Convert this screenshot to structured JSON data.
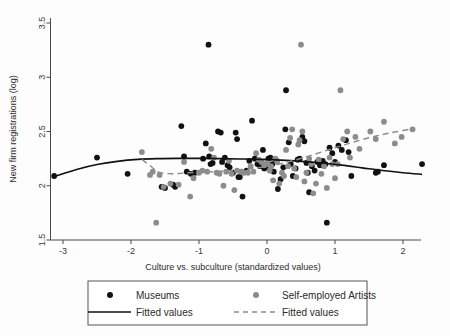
{
  "chart_data": {
    "type": "scatter",
    "title": "",
    "xlabel": "Culture vs. subculture (standardized values)",
    "ylabel": "New firm registrations (log)",
    "xlim": [
      -3.35,
      2.45
    ],
    "ylim": [
      1.45,
      3.58
    ],
    "xticks": [
      -3,
      -2,
      -1,
      0,
      1,
      2
    ],
    "xtick_labels": [
      "-3",
      "-2",
      "-1",
      "0",
      "1",
      "2"
    ],
    "yticks": [
      1.5,
      2,
      2.5,
      3,
      3.5
    ],
    "ytick_labels": [
      "1.5",
      "2",
      "2.5",
      "3",
      "3.5"
    ],
    "grid": false,
    "legend_position": "below-axes",
    "colors": {
      "museums": "#111111",
      "artists": "#8c8c8c",
      "fit_museums": "#111111",
      "fit_artists": "#8c8c8c",
      "axis": "#4a4a4a",
      "background": "#ffffff"
    },
    "series": [
      {
        "name": "Museums",
        "marker": "filled-circle",
        "color": "#111111",
        "points": [
          [
            -3.13,
            2.09
          ],
          [
            -2.5,
            2.26
          ],
          [
            -2.05,
            2.11
          ],
          [
            -1.55,
            1.99
          ],
          [
            -1.5,
            1.98
          ],
          [
            -1.38,
            2.01
          ],
          [
            -1.35,
            1.99
          ],
          [
            -1.26,
            2.55
          ],
          [
            -1.22,
            2.27
          ],
          [
            -1.18,
            2.13
          ],
          [
            -1.12,
            2.11
          ],
          [
            -1.06,
            2.12
          ],
          [
            -0.94,
            2.25
          ],
          [
            -0.9,
            2.39
          ],
          [
            -0.86,
            3.3
          ],
          [
            -0.85,
            2.27
          ],
          [
            -0.83,
            2.2
          ],
          [
            -0.8,
            2.21
          ],
          [
            -0.72,
            2.5
          ],
          [
            -0.68,
            2.49
          ],
          [
            -0.66,
            2.22
          ],
          [
            -0.62,
            2.26
          ],
          [
            -0.58,
            2.19
          ],
          [
            -0.55,
            2.17
          ],
          [
            -0.5,
            2.12
          ],
          [
            -0.46,
            2.49
          ],
          [
            -0.44,
            2.43
          ],
          [
            -0.42,
            2.08
          ],
          [
            -0.4,
            2.08
          ],
          [
            -0.36,
            1.9
          ],
          [
            -0.3,
            2.14
          ],
          [
            -0.26,
            2.23
          ],
          [
            -0.22,
            2.6
          ],
          [
            -0.18,
            2.25
          ],
          [
            -0.14,
            2.2
          ],
          [
            -0.1,
            2.18
          ],
          [
            -0.06,
            2.33
          ],
          [
            -0.04,
            2.16
          ],
          [
            -0.02,
            2.17
          ],
          [
            0.02,
            2.25
          ],
          [
            0.05,
            2.26
          ],
          [
            0.08,
            2.2
          ],
          [
            0.1,
            2.13
          ],
          [
            0.13,
            2.24
          ],
          [
            0.16,
            1.97
          ],
          [
            0.2,
            2.06
          ],
          [
            0.24,
            2.17
          ],
          [
            0.27,
            2.52
          ],
          [
            0.28,
            2.88
          ],
          [
            0.32,
            2.4
          ],
          [
            0.35,
            2.2
          ],
          [
            0.38,
            2.09
          ],
          [
            0.42,
            2.16
          ],
          [
            0.45,
            2.24
          ],
          [
            0.48,
            2.25
          ],
          [
            0.52,
            2.45
          ],
          [
            0.55,
            2.41
          ],
          [
            0.58,
            2.21
          ],
          [
            0.6,
            2.12
          ],
          [
            0.62,
            1.94
          ],
          [
            0.66,
            2.18
          ],
          [
            0.7,
            2.14
          ],
          [
            0.74,
            2.22
          ],
          [
            0.78,
            2.19
          ],
          [
            0.82,
            2.23
          ],
          [
            0.86,
            2.2
          ],
          [
            0.88,
            1.66
          ],
          [
            0.92,
            2.35
          ],
          [
            0.96,
            2.3
          ],
          [
            1.0,
            2.22
          ],
          [
            1.05,
            2.37
          ],
          [
            1.1,
            2.33
          ],
          [
            1.16,
            2.42
          ],
          [
            1.2,
            2.31
          ],
          [
            1.24,
            2.09
          ],
          [
            1.6,
            2.12
          ],
          [
            1.63,
            2.13
          ],
          [
            1.72,
            2.19
          ],
          [
            2.28,
            2.2
          ]
        ]
      },
      {
        "name": "Self-employed Artists",
        "marker": "filled-circle",
        "color": "#8c8c8c",
        "points": [
          [
            -1.84,
            2.31
          ],
          [
            -1.72,
            2.1
          ],
          [
            -1.68,
            2.13
          ],
          [
            -1.63,
            1.66
          ],
          [
            -1.58,
            2.1
          ],
          [
            -1.52,
            1.99
          ],
          [
            -1.42,
            2.02
          ],
          [
            -1.3,
            2.01
          ],
          [
            -1.22,
            2.22
          ],
          [
            -1.13,
            1.9
          ],
          [
            -1.08,
            2.07
          ],
          [
            -1.0,
            2.12
          ],
          [
            -0.95,
            2.14
          ],
          [
            -0.88,
            2.13
          ],
          [
            -0.82,
            2.34
          ],
          [
            -0.78,
            2.26
          ],
          [
            -0.74,
            2.12
          ],
          [
            -0.7,
            2.11
          ],
          [
            -0.64,
            2.0
          ],
          [
            -0.6,
            2.13
          ],
          [
            -0.56,
            2.23
          ],
          [
            -0.52,
            2.11
          ],
          [
            -0.48,
            1.96
          ],
          [
            -0.44,
            2.14
          ],
          [
            -0.38,
            2.13
          ],
          [
            -0.34,
            2.12
          ],
          [
            -0.28,
            2.12
          ],
          [
            -0.24,
            2.18
          ],
          [
            -0.2,
            2.13
          ],
          [
            -0.16,
            2.3
          ],
          [
            -0.12,
            2.24
          ],
          [
            -0.08,
            2.22
          ],
          [
            -0.04,
            2.19
          ],
          [
            0.0,
            2.21
          ],
          [
            0.04,
            2.14
          ],
          [
            0.06,
            2.18
          ],
          [
            0.09,
            2.05
          ],
          [
            0.12,
            2.25
          ],
          [
            0.15,
            2.22
          ],
          [
            0.18,
            2.02
          ],
          [
            0.22,
            2.12
          ],
          [
            0.25,
            2.09
          ],
          [
            0.28,
            2.33
          ],
          [
            0.31,
            2.18
          ],
          [
            0.34,
            2.44
          ],
          [
            0.37,
            2.52
          ],
          [
            0.4,
            2.16
          ],
          [
            0.43,
            2.08
          ],
          [
            0.46,
            2.38
          ],
          [
            0.48,
            2.42
          ],
          [
            0.5,
            3.3
          ],
          [
            0.52,
            2.5
          ],
          [
            0.55,
            2.04
          ],
          [
            0.58,
            2.12
          ],
          [
            0.62,
            2.25
          ],
          [
            0.65,
            2.2
          ],
          [
            0.68,
            1.93
          ],
          [
            0.72,
            2.02
          ],
          [
            0.76,
            2.24
          ],
          [
            0.8,
            2.11
          ],
          [
            0.84,
            2.18
          ],
          [
            0.88,
            1.98
          ],
          [
            0.92,
            2.26
          ],
          [
            0.96,
            2.2
          ],
          [
            1.0,
            2.07
          ],
          [
            1.04,
            2.2
          ],
          [
            1.08,
            2.88
          ],
          [
            1.12,
            2.43
          ],
          [
            1.18,
            2.5
          ],
          [
            1.22,
            2.26
          ],
          [
            1.3,
            2.45
          ],
          [
            1.36,
            2.34
          ],
          [
            1.52,
            2.5
          ],
          [
            1.6,
            2.43
          ],
          [
            1.72,
            2.59
          ],
          [
            1.88,
            2.39
          ],
          [
            1.98,
            2.45
          ],
          [
            2.14,
            2.52
          ]
        ]
      }
    ],
    "fits": [
      {
        "name": "Fitted values",
        "style": "solid",
        "color": "#111111",
        "for_series": "Museums",
        "points": [
          [
            -3.13,
            2.085
          ],
          [
            -2.8,
            2.15
          ],
          [
            -2.5,
            2.195
          ],
          [
            -2.2,
            2.225
          ],
          [
            -1.9,
            2.243
          ],
          [
            -1.6,
            2.25
          ],
          [
            -1.3,
            2.252
          ],
          [
            -1.0,
            2.252
          ],
          [
            -0.7,
            2.25
          ],
          [
            -0.4,
            2.247
          ],
          [
            -0.1,
            2.243
          ],
          [
            0.2,
            2.236
          ],
          [
            0.5,
            2.225
          ],
          [
            0.8,
            2.21
          ],
          [
            1.1,
            2.19
          ],
          [
            1.4,
            2.165
          ],
          [
            1.7,
            2.14
          ],
          [
            2.0,
            2.12
          ],
          [
            2.28,
            2.105
          ]
        ]
      },
      {
        "name": "Fitted values",
        "style": "dashed",
        "color": "#8c8c8c",
        "for_series": "Self-employed Artists",
        "points": [
          [
            -1.84,
            2.243
          ],
          [
            -1.7,
            2.175
          ],
          [
            -1.6,
            2.128
          ],
          [
            -1.45,
            2.112
          ],
          [
            -1.3,
            2.113
          ],
          [
            -1.15,
            2.12
          ],
          [
            -1.0,
            2.124
          ],
          [
            -0.85,
            2.128
          ],
          [
            -0.7,
            2.133
          ],
          [
            -0.5,
            2.142
          ],
          [
            -0.3,
            2.152
          ],
          [
            -0.1,
            2.168
          ],
          [
            0.1,
            2.19
          ],
          [
            0.3,
            2.218
          ],
          [
            0.5,
            2.252
          ],
          [
            0.7,
            2.29
          ],
          [
            0.9,
            2.33
          ],
          [
            1.1,
            2.37
          ],
          [
            1.3,
            2.408
          ],
          [
            1.5,
            2.442
          ],
          [
            1.7,
            2.472
          ],
          [
            1.9,
            2.498
          ],
          [
            2.14,
            2.525
          ]
        ]
      }
    ],
    "legend": {
      "entries": [
        {
          "label": "Museums",
          "marker": "dot",
          "color": "#111111"
        },
        {
          "label": "Self-employed Artists",
          "marker": "dot",
          "color": "#8c8c8c"
        },
        {
          "label": "Fitted values",
          "marker": "solid-line",
          "color": "#111111"
        },
        {
          "label": "Fitted values",
          "marker": "dashed-line",
          "color": "#8c8c8c"
        }
      ]
    }
  }
}
